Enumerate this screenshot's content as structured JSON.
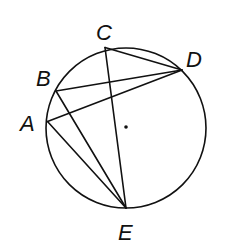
{
  "diagram": {
    "circle": {
      "has_center_dot": true
    },
    "points": [
      {
        "id": "A",
        "label": "A"
      },
      {
        "id": "B",
        "label": "B"
      },
      {
        "id": "C",
        "label": "C"
      },
      {
        "id": "D",
        "label": "D"
      },
      {
        "id": "E",
        "label": "E"
      }
    ],
    "segments": [
      {
        "from": "C",
        "to": "D"
      },
      {
        "from": "C",
        "to": "E"
      },
      {
        "from": "B",
        "to": "D"
      },
      {
        "from": "A",
        "to": "D"
      },
      {
        "from": "B",
        "to": "E"
      },
      {
        "from": "A",
        "to": "E"
      }
    ],
    "colors": {
      "stroke": "#111111",
      "background": "#ffffff"
    }
  }
}
